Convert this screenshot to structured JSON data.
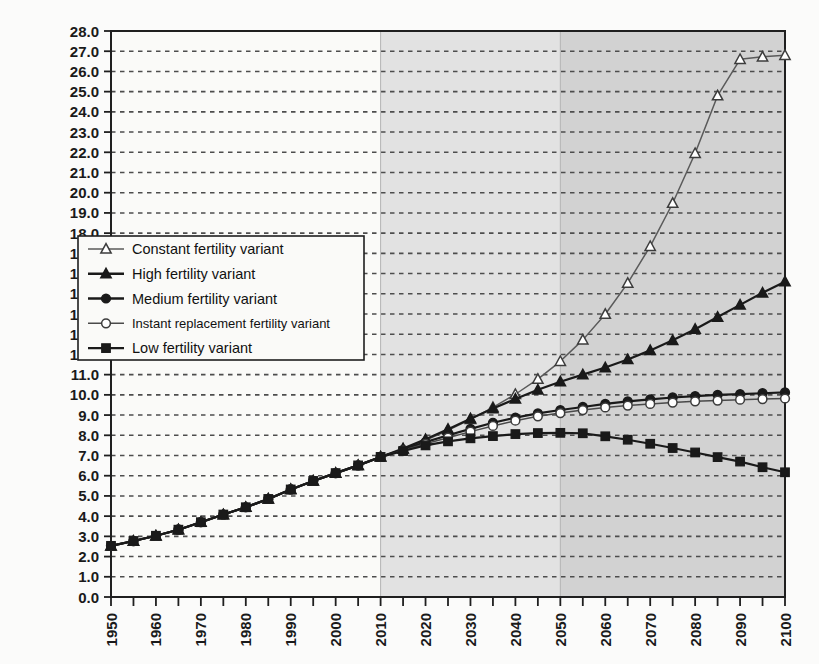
{
  "chart_data": {
    "type": "line",
    "title": "",
    "subtitle": "",
    "xlabel": "",
    "ylabel": "",
    "xlim": [
      1950,
      2100
    ],
    "ylim": [
      0.0,
      28.0
    ],
    "ytick_step": 1.0,
    "grid": true,
    "grid_style": "dotted-horizontal",
    "legend_position": "inside-left-middle",
    "x": [
      1950,
      1955,
      1960,
      1965,
      1970,
      1975,
      1980,
      1985,
      1990,
      1995,
      2000,
      2005,
      2010,
      2015,
      2020,
      2025,
      2030,
      2035,
      2040,
      2045,
      2050,
      2055,
      2060,
      2065,
      2070,
      2075,
      2080,
      2085,
      2090,
      2095,
      2100
    ],
    "x_tick_labels": [
      "1950",
      "1960",
      "1970",
      "1980",
      "1990",
      "2000",
      "2010",
      "2020",
      "2030",
      "2040",
      "2050",
      "2060",
      "2070",
      "2080",
      "2090",
      "2100"
    ],
    "y_tick_labels": [
      "0.0",
      "1.0",
      "2.0",
      "3.0",
      "4.0",
      "5.0",
      "6.0",
      "7.0",
      "8.0",
      "9.0",
      "10.0",
      "11.0",
      "12.0",
      "13.0",
      "14.0",
      "15.0",
      "16.0",
      "17.0",
      "18.0",
      "19.0",
      "20.0",
      "21.0",
      "22.0",
      "23.0",
      "24.0",
      "25.0",
      "26.0",
      "27.0",
      "28.0"
    ],
    "shaded_regions": [
      {
        "name": "projection-light",
        "from": 2010,
        "to": 2050,
        "color": "#e2e2e2"
      },
      {
        "name": "projection-dark",
        "from": 2050,
        "to": 2100,
        "color": "#d2d2d2"
      }
    ],
    "series": [
      {
        "name": "Constant fertility variant",
        "marker": "open-triangle",
        "color": "#5a5a5a",
        "values": [
          2.53,
          2.77,
          3.03,
          3.33,
          3.7,
          4.08,
          4.44,
          4.85,
          5.32,
          5.74,
          6.13,
          6.51,
          6.93,
          7.32,
          7.75,
          8.25,
          8.79,
          9.38,
          10.03,
          10.78,
          11.66,
          12.72,
          13.99,
          15.53,
          17.35,
          19.48,
          21.95,
          24.8,
          26.6,
          26.72,
          26.8
        ]
      },
      {
        "name": "High fertility variant",
        "marker": "filled-triangle",
        "color": "#1a1a1a",
        "values": [
          2.53,
          2.77,
          3.03,
          3.33,
          3.7,
          4.08,
          4.44,
          4.85,
          5.32,
          5.74,
          6.13,
          6.51,
          6.93,
          7.34,
          7.8,
          8.3,
          8.82,
          9.32,
          9.8,
          10.25,
          10.65,
          11.0,
          11.35,
          11.75,
          12.2,
          12.7,
          13.25,
          13.85,
          14.45,
          15.05,
          15.6
        ]
      },
      {
        "name": "Medium fertility variant",
        "marker": "filled-circle",
        "color": "#1a1a1a",
        "values": [
          2.53,
          2.77,
          3.03,
          3.33,
          3.7,
          4.08,
          4.44,
          4.85,
          5.32,
          5.74,
          6.13,
          6.51,
          6.93,
          7.28,
          7.66,
          8.0,
          8.32,
          8.62,
          8.87,
          9.08,
          9.25,
          9.4,
          9.55,
          9.68,
          9.78,
          9.87,
          9.94,
          10.0,
          10.04,
          10.08,
          10.12
        ]
      },
      {
        "name": "Instant replacement fertility variant",
        "marker": "open-circle",
        "color": "#4a4a4a",
        "values": [
          2.53,
          2.77,
          3.03,
          3.33,
          3.7,
          4.08,
          4.44,
          4.85,
          5.32,
          5.74,
          6.13,
          6.51,
          6.93,
          7.25,
          7.58,
          7.88,
          8.18,
          8.46,
          8.72,
          8.94,
          9.1,
          9.25,
          9.38,
          9.47,
          9.55,
          9.62,
          9.68,
          9.72,
          9.76,
          9.79,
          9.82
        ]
      },
      {
        "name": "Low fertility variant",
        "marker": "filled-square",
        "color": "#1a1a1a",
        "values": [
          2.53,
          2.77,
          3.03,
          3.33,
          3.7,
          4.08,
          4.44,
          4.85,
          5.32,
          5.74,
          6.13,
          6.51,
          6.93,
          7.22,
          7.5,
          7.7,
          7.85,
          7.96,
          8.06,
          8.11,
          8.12,
          8.1,
          7.95,
          7.78,
          7.58,
          7.37,
          7.15,
          6.92,
          6.7,
          6.42,
          6.17
        ]
      }
    ]
  },
  "legend": {
    "items": [
      {
        "label": "Constant fertility variant",
        "marker": "open-triangle"
      },
      {
        "label": "High fertility variant",
        "marker": "filled-triangle"
      },
      {
        "label": "Medium fertility variant",
        "marker": "filled-circle"
      },
      {
        "label": "Instant replacement fertility variant",
        "marker": "open-circle"
      },
      {
        "label": "Low fertility variant",
        "marker": "filled-square"
      }
    ]
  }
}
